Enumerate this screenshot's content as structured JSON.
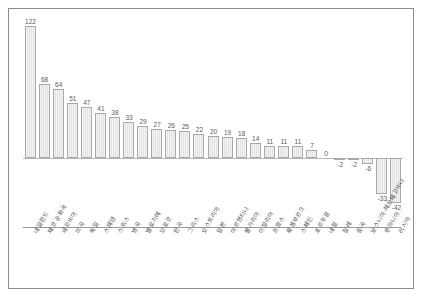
{
  "chart_data": {
    "type": "bar",
    "title": "",
    "subtitle": "",
    "xlabel": "",
    "ylabel": "",
    "grid": false,
    "legend": false,
    "ylim": [
      -50,
      130
    ],
    "orientation": "vertical",
    "categories": [
      "네덜란드",
      "체코 공화국",
      "세르비아",
      "미국",
      "독일",
      "스웨덴",
      "스위스",
      "영국",
      "벨로기에",
      "모로코",
      "한국",
      "그리스",
      "오스트리아",
      "일본",
      "아르헨티나",
      "불가리아",
      "이탈리아",
      "프랑스",
      "룩셈부르크",
      "스페인",
      "포르투갈",
      "네팔",
      "칠레",
      "중국",
      "보스니아-헤르체고비나",
      "루마니아",
      "러시아"
    ],
    "values": [
      122,
      68,
      64,
      51,
      47,
      41,
      38,
      33,
      29,
      27,
      26,
      25,
      22,
      20,
      19,
      18,
      14,
      11,
      11,
      11,
      7,
      0,
      -2,
      -2,
      -6,
      -33,
      -42
    ],
    "data_labels": [
      "122",
      "68",
      "64",
      "51",
      "47",
      "41",
      "38",
      "33",
      "29",
      "27",
      "26",
      "25",
      "22",
      "20",
      "19",
      "18",
      "14",
      "11",
      "11",
      "11",
      "7",
      "0",
      "-2",
      "-2",
      "-6",
      "-33",
      "-42"
    ],
    "bar_color": "#e8e8e8",
    "bar_border_color": "#a8a8a8",
    "baseline_color": "#b9b9b9",
    "frame_color": "#8c8c8c",
    "label_color": "#5a5a5a"
  }
}
